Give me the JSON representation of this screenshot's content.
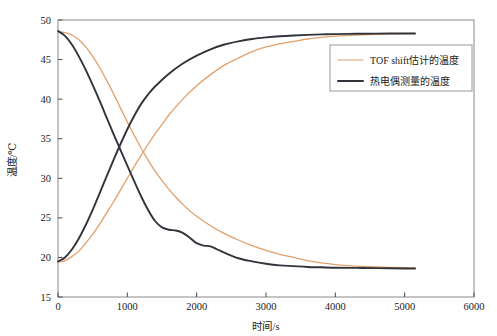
{
  "chart_data": {
    "type": "line",
    "title": "",
    "xlabel": "时间/s",
    "ylabel": "温度/℃",
    "xlim": [
      0,
      6000
    ],
    "ylim": [
      15,
      50
    ],
    "xticks": [
      0,
      1000,
      2000,
      3000,
      4000,
      5000,
      6000
    ],
    "yticks": [
      15,
      20,
      25,
      30,
      35,
      40,
      45,
      50
    ],
    "xtick_labels": [
      "0",
      "1000",
      "2000",
      "3000",
      "4000",
      "5000",
      "6000"
    ],
    "ytick_labels": [
      "15",
      "20",
      "25",
      "30",
      "35",
      "40",
      "45",
      "50"
    ],
    "grid": false,
    "legend_position": "upper-right",
    "colors": {
      "tof": "#E3A06A",
      "thermocouple": "#33333C",
      "frame": "#8A8A8A",
      "background": "#FFFFFF"
    },
    "series": [
      {
        "name": "TOF shift估计的温度",
        "color": "#E3A06A",
        "segments": [
          {
            "label": "cooling",
            "x": [
              0,
              100,
              200,
              300,
              400,
              500,
              600,
              700,
              800,
              900,
              1000,
              1100,
              1200,
              1300,
              1400,
              1500,
              1600,
              1700,
              1800,
              1900,
              2000,
              2200,
              2400,
              2600,
              2800,
              3000,
              3200,
              3400,
              3600,
              3800,
              4000,
              4300,
              4600,
              5000,
              5150
            ],
            "y": [
              48.5,
              48.4,
              48.1,
              47.5,
              46.6,
              45.4,
              44.0,
              42.4,
              40.7,
              38.9,
              37.1,
              35.4,
              33.8,
              32.3,
              30.9,
              29.7,
              28.6,
              27.6,
              26.7,
              25.9,
              25.2,
              24.0,
              23.0,
              22.2,
              21.5,
              20.9,
              20.4,
              20.0,
              19.6,
              19.3,
              19.1,
              18.9,
              18.8,
              18.7,
              18.65
            ]
          },
          {
            "label": "heating",
            "x": [
              0,
              100,
              200,
              300,
              400,
              500,
              600,
              700,
              800,
              900,
              1000,
              1100,
              1200,
              1300,
              1400,
              1500,
              1600,
              1800,
              2000,
              2200,
              2400,
              2600,
              2800,
              3000,
              3200,
              3400,
              3600,
              3800,
              4000,
              4300,
              4600,
              5000,
              5150
            ],
            "y": [
              19.4,
              19.6,
              20.1,
              20.8,
              21.8,
              22.9,
              24.2,
              25.6,
              27.0,
              28.5,
              30.0,
              31.5,
              32.9,
              34.3,
              35.6,
              36.8,
              38.0,
              40.0,
              41.7,
              43.1,
              44.3,
              45.2,
              46.0,
              46.6,
              47.0,
              47.3,
              47.6,
              47.8,
              47.95,
              48.1,
              48.2,
              48.28,
              48.3
            ]
          }
        ]
      },
      {
        "name": "热电偶测量的温度",
        "color": "#33333C",
        "segments": [
          {
            "label": "cooling",
            "x": [
              0,
              100,
              200,
              300,
              400,
              500,
              600,
              700,
              800,
              900,
              1000,
              1100,
              1200,
              1300,
              1400,
              1500,
              1600,
              1700,
              1800,
              1900,
              2000,
              2100,
              2200,
              2300,
              2400,
              2600,
              2800,
              3000,
              3200,
              3400,
              3600,
              3800,
              4000,
              4300,
              4600,
              5000,
              5150
            ],
            "y": [
              48.6,
              48.0,
              46.9,
              45.4,
              43.7,
              41.8,
              39.8,
              37.7,
              35.6,
              33.6,
              31.6,
              29.6,
              27.7,
              26.0,
              24.6,
              23.8,
              23.5,
              23.4,
              23.1,
              22.5,
              21.8,
              21.5,
              21.4,
              21.0,
              20.6,
              19.9,
              19.5,
              19.2,
              19.0,
              18.9,
              18.8,
              18.75,
              18.7,
              18.68,
              18.65,
              18.6,
              18.6
            ]
          },
          {
            "label": "heating",
            "x": [
              0,
              100,
              200,
              300,
              400,
              500,
              600,
              700,
              800,
              900,
              1000,
              1100,
              1200,
              1300,
              1400,
              1600,
              1800,
              2000,
              2200,
              2400,
              2600,
              2800,
              3000,
              3200,
              3400,
              3600,
              3800,
              4000,
              4300,
              4600,
              5000,
              5150
            ],
            "y": [
              19.5,
              20.0,
              21.0,
              22.4,
              24.1,
              26.0,
              28.1,
              30.2,
              32.3,
              34.3,
              36.2,
              37.9,
              39.4,
              40.6,
              41.6,
              43.2,
              44.5,
              45.5,
              46.3,
              46.9,
              47.3,
              47.6,
              47.8,
              47.95,
              48.05,
              48.12,
              48.18,
              48.22,
              48.26,
              48.28,
              48.3,
              48.3
            ]
          }
        ]
      }
    ]
  },
  "legend": {
    "items": [
      {
        "label": "TOF shift估计的温度",
        "color": "#E3A06A",
        "width": 1.2
      },
      {
        "label": "热电偶测量的温度",
        "color": "#33333C",
        "width": 2.0
      }
    ]
  }
}
